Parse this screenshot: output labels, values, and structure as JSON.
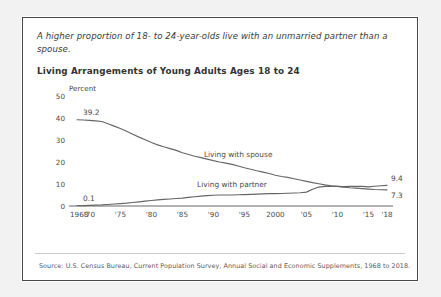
{
  "card": {
    "subtitle": "A higher proportion of 18- to 24-year-olds live with an unmarried partner than a spouse.",
    "source": "Source: U.S. Census Bureau, Current Population Survey, Annual Social and Economic Supplements, 1968 to 2018."
  },
  "chart_data": {
    "type": "line",
    "title": "Living Arrangements of Young Adults Ages 18 to 24",
    "xlabel": "",
    "ylabel": "Percent",
    "unit_label": "Percent",
    "ylim": [
      0,
      50
    ],
    "yticks": [
      "0",
      "10",
      "20",
      "30",
      "40",
      "50"
    ],
    "ytick_values": [
      0,
      10,
      20,
      30,
      40,
      50
    ],
    "xlim": [
      1968,
      2018
    ],
    "xticks": [
      "1968",
      "'70",
      "'75",
      "'80",
      "'85",
      "'90",
      "'95",
      "2000",
      "'05",
      "'10",
      "'15",
      "'18"
    ],
    "xtick_values": [
      1968,
      1970,
      1975,
      1980,
      1985,
      1990,
      1995,
      2000,
      2005,
      2010,
      2015,
      2018
    ],
    "grid": false,
    "legend_position": "inline-annotation",
    "line_color": "#666666",
    "annotations": [
      {
        "name": "spouse-start-value",
        "text": "39.2",
        "x": 1968,
        "y": 39.2
      },
      {
        "name": "partner-start-value",
        "text": "0.1",
        "x": 1968,
        "y": 0.1
      },
      {
        "name": "partner-end-value",
        "text": "9.4",
        "x": 2018,
        "y": 9.4
      },
      {
        "name": "spouse-end-value",
        "text": "7.3",
        "x": 2018,
        "y": 7.3
      }
    ],
    "series": [
      {
        "name": "Living with spouse",
        "label": "Living with spouse",
        "x": [
          1968,
          1969,
          1970,
          1971,
          1972,
          1973,
          1974,
          1975,
          1976,
          1977,
          1978,
          1979,
          1980,
          1981,
          1982,
          1983,
          1984,
          1985,
          1986,
          1987,
          1988,
          1989,
          1990,
          1991,
          1992,
          1993,
          1994,
          1995,
          1996,
          1997,
          1998,
          1999,
          2000,
          2001,
          2002,
          2003,
          2004,
          2005,
          2006,
          2007,
          2008,
          2009,
          2010,
          2011,
          2012,
          2013,
          2014,
          2015,
          2016,
          2017,
          2018
        ],
        "values": [
          39.2,
          39.1,
          38.9,
          38.7,
          38.4,
          37.4,
          36.3,
          35.2,
          34.0,
          32.6,
          31.3,
          30.1,
          28.9,
          27.8,
          26.9,
          26.1,
          25.3,
          24.2,
          23.4,
          22.6,
          22.0,
          21.3,
          20.6,
          20.0,
          19.5,
          18.9,
          18.2,
          17.4,
          16.7,
          16.0,
          15.4,
          14.8,
          14.0,
          13.4,
          13.0,
          12.4,
          11.8,
          11.2,
          10.6,
          10.1,
          9.6,
          9.2,
          8.9,
          8.6,
          8.3,
          8.1,
          7.9,
          7.7,
          7.5,
          7.4,
          7.3
        ]
      },
      {
        "name": "Living with partner",
        "label": "Living with partner",
        "x": [
          1968,
          1969,
          1970,
          1971,
          1972,
          1973,
          1974,
          1975,
          1976,
          1977,
          1978,
          1979,
          1980,
          1981,
          1982,
          1983,
          1984,
          1985,
          1986,
          1987,
          1988,
          1989,
          1990,
          1991,
          1992,
          1993,
          1994,
          1995,
          1996,
          1997,
          1998,
          1999,
          2000,
          2001,
          2002,
          2003,
          2004,
          2005,
          2006,
          2007,
          2008,
          2009,
          2010,
          2011,
          2012,
          2013,
          2014,
          2015,
          2016,
          2017,
          2018
        ],
        "values": [
          0.1,
          0.2,
          0.3,
          0.4,
          0.5,
          0.7,
          0.9,
          1.1,
          1.3,
          1.6,
          1.9,
          2.2,
          2.5,
          2.8,
          3.0,
          3.2,
          3.4,
          3.6,
          3.9,
          4.2,
          4.5,
          4.7,
          4.9,
          5.0,
          5.0,
          5.0,
          5.1,
          5.2,
          5.3,
          5.4,
          5.5,
          5.6,
          5.6,
          5.7,
          5.8,
          5.9,
          6.0,
          6.3,
          7.6,
          8.6,
          8.9,
          9.0,
          8.9,
          8.8,
          8.9,
          9.0,
          8.9,
          8.7,
          9.0,
          9.2,
          9.4
        ]
      }
    ]
  }
}
